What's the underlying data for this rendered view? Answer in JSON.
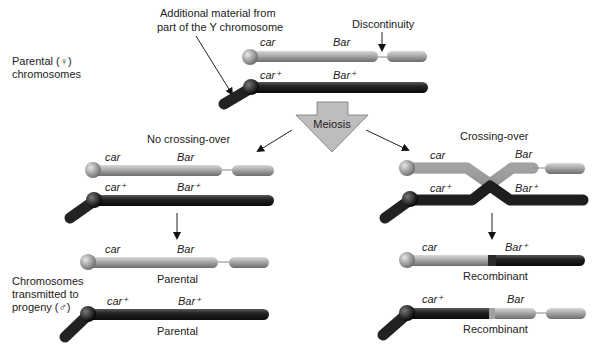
{
  "annotations": {
    "additional_material_line1": "Additional material from",
    "additional_material_line2": "part of the Y chromosome",
    "discontinuity": "Discontinuity",
    "parental_female_line1": "Parental (♀)",
    "parental_female_line2": "chromosomes",
    "meiosis": "Meiosis",
    "no_crossing_over": "No crossing-over",
    "crossing_over": "Crossing-over",
    "transmitted_line1": "Chromosomes",
    "transmitted_line2": "transmitted to",
    "transmitted_line3": "progeny (♂)"
  },
  "genes": {
    "car": "car",
    "car_plus": "car⁺",
    "bar": "Bar",
    "bar_plus": "Bar⁺"
  },
  "outcomes": {
    "left_top": "Parental",
    "left_bottom": "Parental",
    "right_top": "Recombinant",
    "right_bottom": "Recombinant"
  },
  "colors": {
    "light_chromosome": "#9a9a9a",
    "dark_chromosome": "#1e1e1e",
    "meiosis_arrow": "#bdbdbd"
  }
}
